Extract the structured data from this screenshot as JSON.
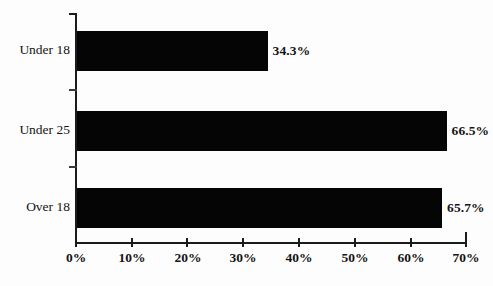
{
  "chart_data": {
    "type": "bar",
    "orientation": "horizontal",
    "title": "",
    "subtitle": "",
    "xlabel": "",
    "ylabel": "",
    "categories": [
      "Under 18",
      "Under 25",
      "Over 18"
    ],
    "values": [
      34.3,
      66.5,
      65.7
    ],
    "value_labels": [
      "34.3%",
      "66.5%",
      "65.7%"
    ],
    "xlim": [
      0,
      70
    ],
    "xtick_values": [
      0,
      10,
      20,
      30,
      40,
      50,
      60,
      70
    ],
    "xtick_labels": [
      "0%",
      "10%",
      "20%",
      "30%",
      "40%",
      "50%",
      "60%",
      "70%"
    ],
    "grid": false,
    "legend": false,
    "legend_position": "none",
    "series": [
      {
        "name": "",
        "values": [
          34.3,
          66.5,
          65.7
        ],
        "color": "#050505"
      }
    ]
  },
  "style": {
    "background": "#fdfdfd",
    "bar_color": "#050505",
    "axis_color": "#1b1b1b",
    "text_color": "#141414"
  }
}
